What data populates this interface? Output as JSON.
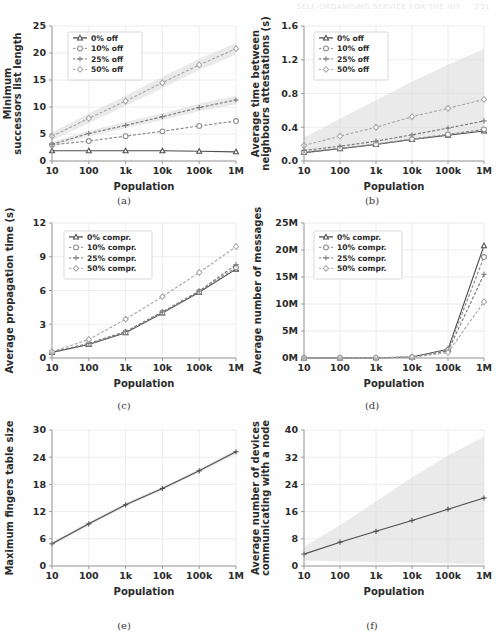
{
  "header": {
    "title": "SELF-ORGANISING SERVICE FOR THE IOT",
    "page_number": "231"
  },
  "figure": {
    "xlabel": "Population",
    "categories": [
      "10",
      "100",
      "1k",
      "10k",
      "100k",
      "1M"
    ],
    "captions": [
      "(a)",
      "(b)",
      "(c)",
      "(d)",
      "(e)",
      "(f)"
    ]
  },
  "chart_data": [
    {
      "panel": "a",
      "caption": "(a)",
      "type": "line",
      "title": "",
      "xlabel": "Population",
      "ylabel": "Minimum successors list length",
      "categories": [
        "10",
        "100",
        "1k",
        "10k",
        "100k",
        "1M"
      ],
      "yticks": [
        0,
        5,
        10,
        15,
        20,
        25
      ],
      "ylim": [
        0,
        25
      ],
      "grid": true,
      "legend_position": "upper-left",
      "series": [
        {
          "name": "0% off",
          "marker": "triangle",
          "values": [
            1.9,
            1.9,
            1.9,
            1.9,
            1.8,
            1.7
          ]
        },
        {
          "name": "10% off",
          "marker": "circle",
          "values": [
            3.0,
            3.7,
            4.6,
            5.5,
            6.5,
            7.4
          ]
        },
        {
          "name": "25% off",
          "marker": "plus",
          "values": [
            3.1,
            5.1,
            6.6,
            8.2,
            9.9,
            11.3
          ]
        },
        {
          "name": "50% off",
          "marker": "diamond",
          "values": [
            4.6,
            7.9,
            11.1,
            14.5,
            17.8,
            20.8
          ]
        }
      ],
      "bands": [
        {
          "series": "50% off",
          "lower": [
            3.9,
            7.0,
            10.2,
            13.5,
            16.8,
            19.7
          ],
          "upper": [
            5.3,
            8.8,
            12.1,
            15.6,
            18.9,
            21.9
          ]
        },
        {
          "series": "25% off",
          "lower": [
            2.7,
            4.6,
            6.1,
            7.6,
            9.2,
            10.5
          ],
          "upper": [
            3.5,
            5.6,
            7.2,
            8.8,
            10.6,
            12.1
          ]
        }
      ]
    },
    {
      "panel": "b",
      "caption": "(b)",
      "type": "line",
      "title": "",
      "xlabel": "Population",
      "ylabel": "Average time between neighbours attestations (s)",
      "categories": [
        "10",
        "100",
        "1k",
        "10k",
        "100k",
        "1M"
      ],
      "yticks": [
        0.0,
        0.4,
        0.8,
        1.2,
        1.6
      ],
      "ytick_labels": [
        "0.0",
        "0.4",
        "0.8",
        "1.2",
        "1.6"
      ],
      "ylim": [
        0,
        1.6
      ],
      "grid": true,
      "legend_position": "upper-left",
      "series": [
        {
          "name": "0% off",
          "marker": "triangle",
          "values": [
            0.1,
            0.145,
            0.195,
            0.255,
            0.305,
            0.355
          ]
        },
        {
          "name": "10% off",
          "marker": "circle",
          "values": [
            0.105,
            0.15,
            0.2,
            0.26,
            0.315,
            0.375
          ]
        },
        {
          "name": "25% off",
          "marker": "plus",
          "values": [
            0.125,
            0.175,
            0.235,
            0.31,
            0.39,
            0.475
          ]
        },
        {
          "name": "50% off",
          "marker": "diamond",
          "values": [
            0.185,
            0.295,
            0.4,
            0.525,
            0.625,
            0.73
          ]
        }
      ],
      "bands": [
        {
          "series": "50% off",
          "lower": [
            0.09,
            0.14,
            0.19,
            0.25,
            0.3,
            0.36
          ],
          "upper": [
            0.28,
            0.5,
            0.72,
            0.94,
            1.14,
            1.33
          ]
        }
      ]
    },
    {
      "panel": "c",
      "caption": "(c)",
      "type": "line",
      "title": "",
      "xlabel": "Population",
      "ylabel": "Average propagation time (s)",
      "categories": [
        "10",
        "100",
        "1k",
        "10k",
        "100k",
        "1M"
      ],
      "yticks": [
        0,
        3,
        6,
        9,
        12
      ],
      "ylim": [
        0,
        12
      ],
      "grid": true,
      "legend_position": "upper-left",
      "series": [
        {
          "name": "0% compr.",
          "marker": "triangle",
          "values": [
            0.5,
            1.2,
            2.25,
            4.0,
            5.85,
            7.9
          ]
        },
        {
          "name": "10% compr.",
          "marker": "circle",
          "values": [
            0.5,
            1.25,
            2.3,
            4.05,
            5.9,
            8.05
          ]
        },
        {
          "name": "25% compr.",
          "marker": "plus",
          "values": [
            0.52,
            1.3,
            2.35,
            4.1,
            5.95,
            8.3
          ]
        },
        {
          "name": "50% compr.",
          "marker": "diamond",
          "values": [
            0.55,
            1.65,
            3.45,
            5.45,
            7.6,
            9.9
          ]
        }
      ],
      "bands": []
    },
    {
      "panel": "d",
      "caption": "(d)",
      "type": "line",
      "title": "",
      "xlabel": "Population",
      "ylabel": "Average number of messages",
      "categories": [
        "10",
        "100",
        "1k",
        "10k",
        "100k",
        "1M"
      ],
      "yticks": [
        0,
        5,
        10,
        15,
        20,
        25
      ],
      "ytick_labels": [
        "0M",
        "5M",
        "10M",
        "15M",
        "20M",
        "25M"
      ],
      "ylim": [
        0,
        25
      ],
      "unit": "M",
      "grid": true,
      "legend_position": "upper-left",
      "series": [
        {
          "name": "0% compr.",
          "marker": "triangle",
          "values": [
            0.0,
            0.01,
            0.03,
            0.18,
            1.6,
            20.8
          ]
        },
        {
          "name": "10% compr.",
          "marker": "circle",
          "values": [
            0.0,
            0.01,
            0.03,
            0.17,
            1.5,
            18.7
          ]
        },
        {
          "name": "25% compr.",
          "marker": "plus",
          "values": [
            0.0,
            0.01,
            0.03,
            0.15,
            1.3,
            15.5
          ]
        },
        {
          "name": "50% compr.",
          "marker": "diamond",
          "values": [
            0.0,
            0.01,
            0.02,
            0.12,
            1.0,
            10.4
          ]
        }
      ],
      "bands": []
    },
    {
      "panel": "e",
      "caption": "(e)",
      "type": "line",
      "title": "",
      "xlabel": "Population",
      "ylabel": "Maximum fingers table size",
      "categories": [
        "10",
        "100",
        "1k",
        "10k",
        "100k",
        "1M"
      ],
      "yticks": [
        0,
        6,
        12,
        18,
        24,
        30
      ],
      "ylim": [
        0,
        30
      ],
      "grid": true,
      "legend_position": "none",
      "series": [
        {
          "name": "fingers",
          "marker": "plus",
          "values": [
            4.9,
            9.3,
            13.5,
            17.1,
            21.0,
            25.2
          ]
        }
      ],
      "bands": [
        {
          "series": "fingers",
          "lower": [
            4.5,
            8.9,
            13.1,
            16.7,
            20.6,
            24.7
          ],
          "upper": [
            5.3,
            9.7,
            13.9,
            17.5,
            21.4,
            25.7
          ]
        }
      ]
    },
    {
      "panel": "f",
      "caption": "(f)",
      "type": "line",
      "title": "",
      "xlabel": "Population",
      "ylabel": "Average number of devices communicating with a node",
      "categories": [
        "10",
        "100",
        "1k",
        "10k",
        "100k",
        "1M"
      ],
      "yticks": [
        0,
        8,
        16,
        24,
        32,
        40
      ],
      "ylim": [
        0,
        40
      ],
      "grid": true,
      "legend_position": "none",
      "series": [
        {
          "name": "devices",
          "marker": "plus",
          "values": [
            3.5,
            7.0,
            10.2,
            13.4,
            16.7,
            20.0
          ]
        }
      ],
      "bands": [
        {
          "series": "devices",
          "lower": [
            1.6,
            1.4,
            1.2,
            1.0,
            0.8,
            0.6
          ],
          "upper": [
            5.6,
            12.0,
            19.0,
            26.0,
            32.5,
            38.0
          ]
        }
      ]
    }
  ],
  "colors": {
    "series_0": "#4d4d4d",
    "series_1": "#8c8c8c",
    "series_2": "#7a7a7a",
    "series_3": "#a8a8a8",
    "band": "#d9d9d9",
    "grid": "#e9eaee",
    "axis": "#9a9a9a",
    "text": "#2b2b2b"
  }
}
